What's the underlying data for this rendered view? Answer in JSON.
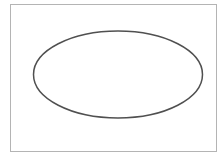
{
  "canvas": {
    "width": 224,
    "height": 157,
    "background": "#ffffff"
  },
  "frame": {
    "x": 10.5,
    "y": 4.5,
    "width": 206,
    "height": 147,
    "stroke": "#b4b4b4",
    "stroke_width": 1
  },
  "shapes": [
    {
      "type": "ellipse",
      "cx": 118,
      "cy": 74.5,
      "rx": 84.5,
      "ry": 43.5,
      "stroke": "#505050",
      "stroke_width": 1.5,
      "fill": "none"
    }
  ]
}
